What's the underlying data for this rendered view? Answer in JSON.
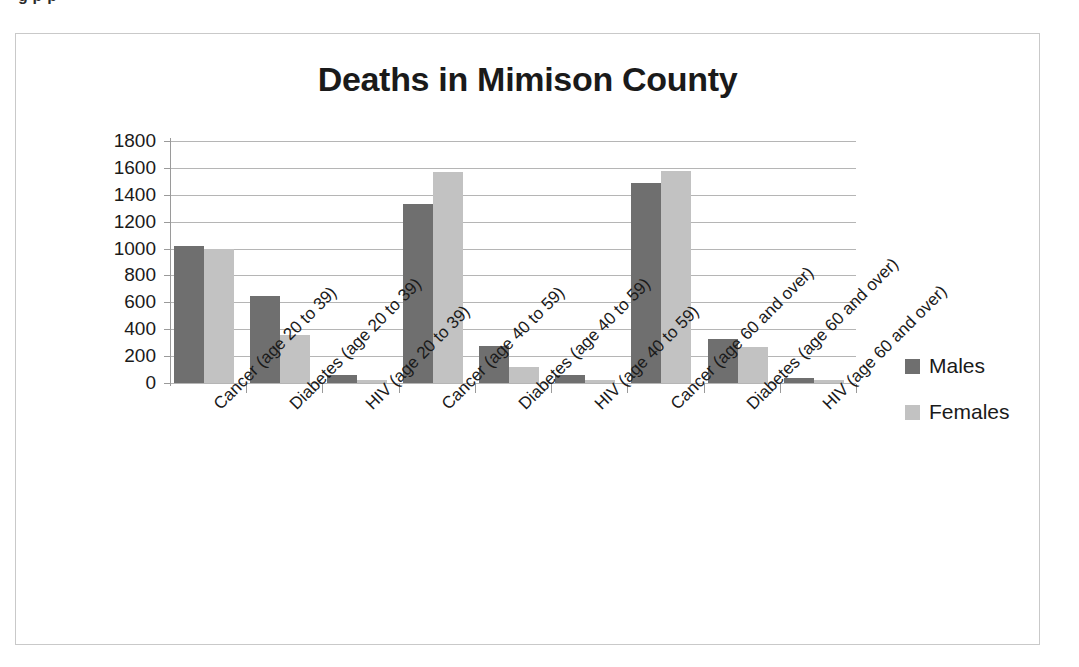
{
  "top_clipped_text": "g p  p",
  "legend": {
    "position": "right",
    "entries": [
      {
        "label": "Males",
        "color": "#6f6f6f"
      },
      {
        "label": "Females",
        "color": "#c2c2c2"
      }
    ]
  },
  "chart_data": {
    "type": "bar",
    "title": "Deaths in Mimison County",
    "xlabel": "",
    "ylabel": "",
    "ylim": [
      0,
      1800
    ],
    "ytick_step": 200,
    "yticks": [
      1800,
      1600,
      1400,
      1200,
      1000,
      800,
      600,
      400,
      200,
      0
    ],
    "grid": true,
    "grid_axis": "y",
    "legend_position": "right",
    "categories": [
      "Cancer (age 20 to 39)",
      "Diabetes (age 20 to 39)",
      "HIV (age 20 to 39)",
      "Cancer (age 40 to 59)",
      "Diabetes (age 40 to 59)",
      "HIV (age 40 to 59)",
      "Cancer (age 60 and over)",
      "Diabetes (age 60 and over)",
      "HIV (age 60 and over)"
    ],
    "series": [
      {
        "name": "Males",
        "color": "#6f6f6f",
        "values": [
          1020,
          645,
          60,
          1330,
          275,
          60,
          1490,
          330,
          35
        ]
      },
      {
        "name": "Females",
        "color": "#c2c2c2",
        "values": [
          1000,
          360,
          25,
          1570,
          120,
          25,
          1580,
          265,
          25
        ]
      }
    ]
  }
}
